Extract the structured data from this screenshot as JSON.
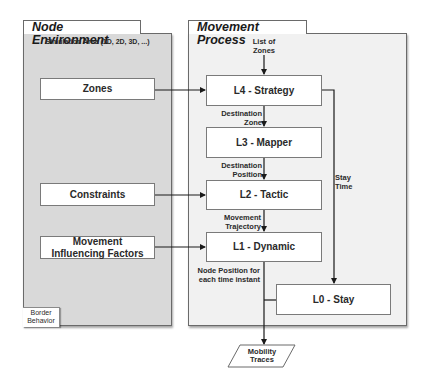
{
  "left_panel": {
    "title": "Node Environment",
    "subtitle": "Simulation Area (1D, 2D, 3D, ...)",
    "inputs": [
      {
        "label": "Zones"
      },
      {
        "label": "Constraints"
      },
      {
        "label": "Movement Influencing Factors"
      }
    ],
    "corner_note": "Border Behavior"
  },
  "right_panel": {
    "title": "Movement Process",
    "input_label": "List of Zones",
    "layers": [
      {
        "id": "L4",
        "label": "L4 - Strategy"
      },
      {
        "id": "L3",
        "label": "L3 - Mapper"
      },
      {
        "id": "L2",
        "label": "L2 - Tactic"
      },
      {
        "id": "L1",
        "label": "L1 - Dynamic"
      },
      {
        "id": "L0",
        "label": "L0 - Stay"
      }
    ],
    "edge_labels": {
      "l4_to_l3": "Destination Zone",
      "l3_to_l2": "Destination Position",
      "l2_to_l1": "Movement Trajectory",
      "l1_out": "Node Position for each time instant",
      "l4_to_l0": "Stay Time"
    }
  },
  "output": {
    "label": "Mobility Traces"
  },
  "colors": {
    "left_panel_bg": "#d9d9d9",
    "right_panel_bg": "#f1f1f1",
    "box_bg": "#ffffff",
    "line": "#1a1a1a"
  }
}
